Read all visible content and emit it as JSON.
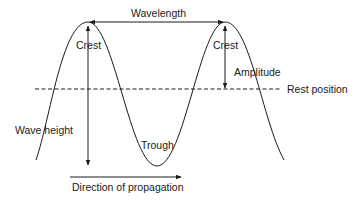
{
  "diagram": {
    "type": "transverse-wave",
    "labels": {
      "wavelength": "Wavelength",
      "crest_left": "Crest",
      "crest_right": "Crest",
      "amplitude": "Amplitude",
      "rest_position": "Rest position",
      "wave_height": "Wave height",
      "trough": "Trough",
      "direction": "Direction of propagation"
    },
    "colors": {
      "line": "#1a1a1a",
      "background": "#ffffff"
    }
  }
}
